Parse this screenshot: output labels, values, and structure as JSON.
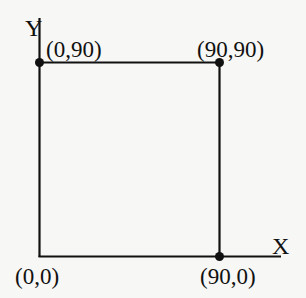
{
  "diagram": {
    "axes": {
      "x_label": "X",
      "y_label": "Y"
    },
    "square": {
      "corners": [
        {
          "id": "origin",
          "label": "(0,0)",
          "x": 0,
          "y": 0,
          "marked": false
        },
        {
          "id": "top-left",
          "label": "(0,90)",
          "x": 0,
          "y": 90,
          "marked": true
        },
        {
          "id": "top-right",
          "label": "(90,90)",
          "x": 90,
          "y": 90,
          "marked": true
        },
        {
          "id": "bottom-right",
          "label": "(90,0)",
          "x": 90,
          "y": 0,
          "marked": true
        }
      ]
    },
    "colors": {
      "line": "#111111",
      "background": "#f7f7f5"
    }
  }
}
